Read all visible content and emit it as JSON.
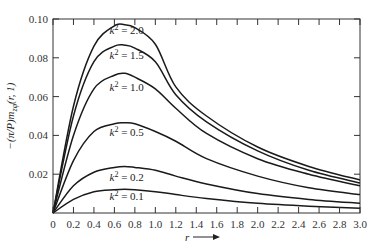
{
  "chart_data": {
    "type": "line",
    "title": "",
    "xlabel": "r",
    "ylabel": "-(π/P)m_zφ(r, 1)",
    "xlim": [
      0,
      3.0
    ],
    "ylim": [
      0,
      0.1
    ],
    "grid": false,
    "legend": "inline labels",
    "x_ticks": [
      "0",
      "0.2",
      "0.4",
      "0.6",
      "0.8",
      "1.0",
      "1.2",
      "1.4",
      "1.6",
      "1.8",
      "2.0",
      "2.2",
      "2.4",
      "2.6",
      "2.8",
      "3.0"
    ],
    "y_ticks": [
      "0.02",
      "0.04",
      "0.06",
      "0.08",
      "0.10"
    ],
    "x": [
      0,
      0.2,
      0.4,
      0.6,
      0.7,
      0.8,
      1.0,
      1.2,
      1.5,
      2.0,
      2.5,
      3.0
    ],
    "series": [
      {
        "name": "k² = 2.0",
        "label_k": "2.0",
        "values": [
          0,
          0.055,
          0.086,
          0.0965,
          0.097,
          0.0955,
          0.087,
          0.065,
          0.05,
          0.034,
          0.024,
          0.017
        ]
      },
      {
        "name": "k² = 1.5",
        "label_k": "1.5",
        "values": [
          0,
          0.05,
          0.078,
          0.086,
          0.0865,
          0.085,
          0.078,
          0.061,
          0.047,
          0.032,
          0.022,
          0.0155
        ]
      },
      {
        "name": "k² = 1.0",
        "label_k": "1.0",
        "values": [
          0,
          0.04,
          0.064,
          0.071,
          0.072,
          0.07,
          0.064,
          0.054,
          0.041,
          0.028,
          0.02,
          0.014
        ]
      },
      {
        "name": "k² = 0.5",
        "label_k": "0.5",
        "values": [
          0,
          0.027,
          0.042,
          0.046,
          0.0465,
          0.046,
          0.042,
          0.037,
          0.028,
          0.019,
          0.013,
          0.0095
        ]
      },
      {
        "name": "k² = 0.2",
        "label_k": "0.2",
        "values": [
          0,
          0.014,
          0.021,
          0.0235,
          0.024,
          0.0235,
          0.022,
          0.019,
          0.015,
          0.01,
          0.007,
          0.005
        ]
      },
      {
        "name": "k² = 0.1",
        "label_k": "0.1",
        "values": [
          0,
          0.007,
          0.011,
          0.012,
          0.0122,
          0.012,
          0.011,
          0.0095,
          0.0075,
          0.005,
          0.0035,
          0.0025
        ]
      }
    ],
    "label_positions": {
      "2.0": {
        "r": 0.72,
        "y": 0.0925
      },
      "1.5": {
        "r": 0.72,
        "y": 0.0795
      },
      "1.0": {
        "r": 0.72,
        "y": 0.063
      },
      "0.5": {
        "r": 0.72,
        "y": 0.0395
      },
      "0.2": {
        "r": 0.72,
        "y": 0.0165
      },
      "0.1": {
        "r": 0.72,
        "y": 0.0065
      }
    }
  },
  "axis": {
    "y_label": "−(π/P)m",
    "y_label_sub": "zφ",
    "y_label_tail": "(r, 1)",
    "x_label": "r"
  }
}
